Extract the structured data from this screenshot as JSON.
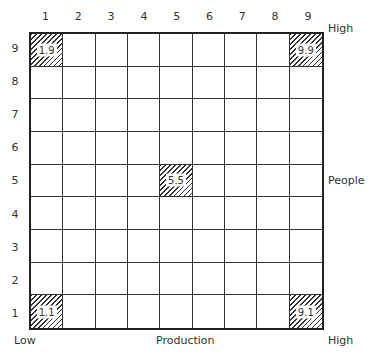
{
  "grid": {
    "rows": 9,
    "cols": 9,
    "x_ticks": [
      "1",
      "2",
      "3",
      "4",
      "5",
      "6",
      "7",
      "8",
      "9"
    ],
    "y_ticks": [
      "9",
      "8",
      "7",
      "6",
      "5",
      "4",
      "3",
      "2",
      "1"
    ],
    "highlighted_cells": [
      {
        "x": 1,
        "y": 9,
        "label": "1.9"
      },
      {
        "x": 9,
        "y": 9,
        "label": "9.9"
      },
      {
        "x": 5,
        "y": 5,
        "label": "5.5"
      },
      {
        "x": 1,
        "y": 1,
        "label": "1.1"
      },
      {
        "x": 9,
        "y": 1,
        "label": "9.1"
      }
    ]
  },
  "axes": {
    "x_label": "Production",
    "y_label": "People",
    "low_label": "Low",
    "x_high_label": "High",
    "y_high_label": "High"
  }
}
